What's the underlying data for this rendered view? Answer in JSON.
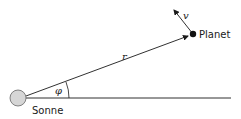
{
  "diagram": {
    "sun": {
      "label": "Sonne",
      "color": "#d6d6d6",
      "stroke": "#666666"
    },
    "planet": {
      "label": "Planet",
      "color": "#111111"
    },
    "radius_label": "r",
    "angle_label": "φ",
    "velocity_label": "v",
    "line_color": "#1a1a1a"
  }
}
